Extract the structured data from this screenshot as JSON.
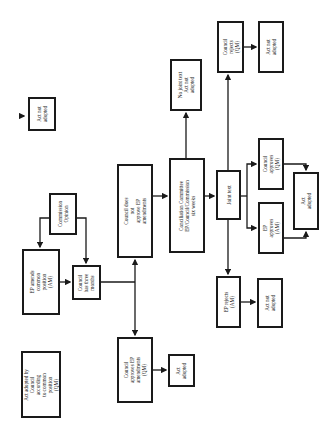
{
  "diagram": {
    "title": "",
    "orientation": "rotated-90-ccw",
    "nodes": [
      {
        "id": "act_not_adopted_top",
        "label": "Act not\nadopted",
        "x": 28,
        "y": 97,
        "w": 28,
        "h": 34
      },
      {
        "id": "ep_amends",
        "label": "EP amends\ncommon position\n(AM)",
        "x": 22,
        "y": 249,
        "w": 38,
        "h": 66
      },
      {
        "id": "act_adopted_common",
        "label": "Act adopted by\nCouncil according\nto common position\n(QM)",
        "x": 21,
        "y": 351,
        "w": 40,
        "h": 67
      },
      {
        "id": "commission_opinion",
        "label": "Commission\nOpinion",
        "x": 49,
        "y": 193,
        "w": 28,
        "h": 42
      },
      {
        "id": "council_three_months",
        "label": "Council\nhas three\nmonths",
        "x": 72,
        "y": 265,
        "w": 29,
        "h": 35
      },
      {
        "id": "council_not_approve",
        "label": "Council does not\napprove EP\namendments",
        "x": 117,
        "y": 164,
        "w": 36,
        "h": 94
      },
      {
        "id": "council_approves_ep",
        "label": "Council approves EP\namendments (QM)",
        "x": 117,
        "y": 337,
        "w": 36,
        "h": 66
      },
      {
        "id": "act_adopted_lower",
        "label": "Act\nadopted",
        "x": 168,
        "y": 354,
        "w": 27,
        "h": 33
      },
      {
        "id": "conciliation",
        "label": "Conciliation Committee\nEP/Council/Commission\nsix weeks",
        "x": 169,
        "y": 158,
        "w": 36,
        "h": 95
      },
      {
        "id": "no_joint_text",
        "label": "No joint text\nAct not adopted",
        "x": 170,
        "y": 59,
        "w": 32,
        "h": 52
      },
      {
        "id": "joint_text",
        "label": "Joint text",
        "x": 216,
        "y": 170,
        "w": 25,
        "h": 50
      },
      {
        "id": "council_rejects",
        "label": "Council rejects\n(QM)",
        "x": 217,
        "y": 21,
        "w": 27,
        "h": 52
      },
      {
        "id": "act_not_adopted_tr",
        "label": "Act not adopted",
        "x": 258,
        "y": 21,
        "w": 26,
        "h": 52
      },
      {
        "id": "council_approves_qm",
        "label": "Council approves\n(QM)",
        "x": 258,
        "y": 138,
        "w": 26,
        "h": 52
      },
      {
        "id": "ep_approves",
        "label": "EP approves\n(AM)",
        "x": 258,
        "y": 202,
        "w": 26,
        "h": 52
      },
      {
        "id": "act_adopted_right",
        "label": "Act adopted",
        "x": 293,
        "y": 172,
        "w": 26,
        "h": 58
      },
      {
        "id": "ep_rejects",
        "label": "EP rejects (AM)",
        "x": 216,
        "y": 276,
        "w": 25,
        "h": 52
      },
      {
        "id": "act_not_adopted_lr",
        "label": "Act not adopted",
        "x": 257,
        "y": 278,
        "w": 26,
        "h": 50
      }
    ],
    "edges": [
      {
        "from": "commission_opinion",
        "to": "ep_amends"
      },
      {
        "from": "commission_opinion",
        "to": "council_three_months"
      },
      {
        "from": "ep_amends",
        "to": "council_three_months"
      },
      {
        "from": "council_three_months",
        "to": "council_not_approve"
      },
      {
        "from": "council_three_months",
        "to": "council_approves_ep"
      },
      {
        "from": "council_not_approve",
        "to": "conciliation"
      },
      {
        "from": "council_approves_ep",
        "to": "act_adopted_lower"
      },
      {
        "from": "conciliation",
        "to": "no_joint_text"
      },
      {
        "from": "conciliation",
        "to": "joint_text"
      },
      {
        "from": "joint_text",
        "to": "council_rejects"
      },
      {
        "from": "joint_text",
        "to": "council_approves_qm"
      },
      {
        "from": "joint_text",
        "to": "ep_approves"
      },
      {
        "from": "joint_text",
        "to": "ep_rejects"
      },
      {
        "from": "council_rejects",
        "to": "act_not_adopted_tr"
      },
      {
        "from": "council_approves_qm",
        "to": "act_adopted_right"
      },
      {
        "from": "ep_approves",
        "to": "act_adopted_right"
      },
      {
        "from": "ep_rejects",
        "to": "act_not_adopted_lr"
      }
    ]
  },
  "labels": {
    "act_not_adopted_top": "Act not\nadopted",
    "ep_amends": "EP amends\ncommon position\n(AM)",
    "act_adopted_common": "Act adopted by\nCouncil according\nto common position\n(QM)",
    "commission_opinion": "Commission\nOpinion",
    "council_three_months": "Council\nhas three\nmonths",
    "council_not_approve": "Council does not\napprove EP\namendments",
    "council_approves_ep": "Council approves EP\namendments (QM)",
    "act_adopted_lower": "Act\nadopted",
    "conciliation": "Conciliation Committee\nEP/Council/Commission\nsix weeks",
    "no_joint_text": "No joint text\nAct not adopted",
    "joint_text": "Joint text",
    "council_rejects": "Council rejects\n(QM)",
    "act_not_adopted_tr": "Act not adopted",
    "council_approves_qm": "Council approves\n(QM)",
    "ep_approves": "EP approves\n(AM)",
    "act_adopted_right": "Act adopted",
    "ep_rejects": "EP rejects (AM)",
    "act_not_adopted_lr": "Act not adopted"
  },
  "colors": {
    "stroke": "#1a1a1a",
    "background": "#ffffff"
  }
}
